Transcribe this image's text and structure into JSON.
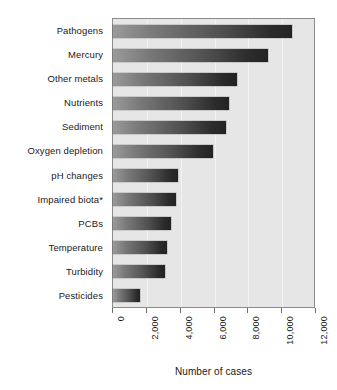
{
  "chart_data": {
    "type": "bar",
    "orientation": "horizontal",
    "title": "",
    "xlabel": "Number of cases",
    "ylabel": "",
    "categories": [
      "Pathogens",
      "Mercury",
      "Other metals",
      "Nutrients",
      "Sediment",
      "Oxygen depletion",
      "pH changes",
      "Impaired biota*",
      "PCBs",
      "Temperature",
      "Turbidity",
      "Pesticides"
    ],
    "values": [
      10600,
      9150,
      7350,
      6850,
      6700,
      5900,
      3850,
      3700,
      3400,
      3200,
      3050,
      1600
    ],
    "xlim": [
      0,
      12000
    ],
    "xticks": [
      0,
      2000,
      4000,
      6000,
      8000,
      10000,
      12000
    ],
    "xtick_labels": [
      "0",
      "2,000",
      "4,000",
      "6,000",
      "8,000",
      "10,000",
      "12,000"
    ],
    "grid": true,
    "grid_axis": "x",
    "legend": false,
    "bar_color_start": "#9a9a9a",
    "bar_color_end": "#232323",
    "plot_background": "#e6e6e6",
    "gridline_color": "#f2f2f2"
  }
}
